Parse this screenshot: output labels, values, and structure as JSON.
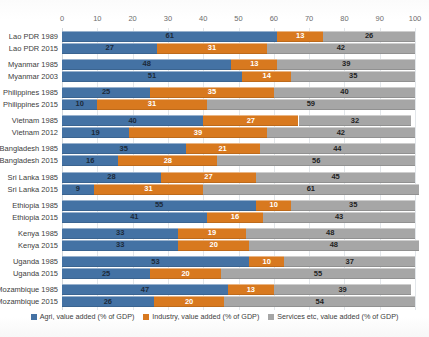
{
  "title": "",
  "chart_data": {
    "type": "bar",
    "orientation": "horizontal",
    "stacked": true,
    "title": "",
    "xlabel": "",
    "ylabel": "",
    "xlim": [
      0,
      100
    ],
    "xticks": [
      0,
      10,
      20,
      30,
      40,
      50,
      60,
      70,
      80,
      90,
      100
    ],
    "grid": true,
    "legend_position": "bottom",
    "colors": {
      "agriculture": "#4472a4",
      "industry": "#d8791f",
      "services": "#a6a6a6"
    },
    "legend": [
      "Agri, value added (% of GDP)",
      "Industry, value added (% of GDP)",
      "Services etc, value added (% of GDP)"
    ],
    "series": [
      {
        "name": "Agri, value added (% of GDP)",
        "key": "agriculture"
      },
      {
        "name": "Industry, value added (% of GDP)",
        "key": "industry"
      },
      {
        "name": "Services etc, value added (% of GDP)",
        "key": "services"
      }
    ],
    "groups": [
      {
        "country": "Lao PDR",
        "rows": [
          {
            "category": "Lao PDR 1989",
            "agriculture": 61,
            "industry": 13,
            "services": 26
          },
          {
            "category": "Lao PDR 2015",
            "agriculture": 27,
            "industry": 31,
            "services": 42
          }
        ]
      },
      {
        "country": "Myanmar",
        "rows": [
          {
            "category": "Myanmar 1985",
            "agriculture": 48,
            "industry": 13,
            "services": 39
          },
          {
            "category": "Myanmar 2003",
            "agriculture": 51,
            "industry": 14,
            "services": 35
          }
        ]
      },
      {
        "country": "Philippines",
        "rows": [
          {
            "category": "Philippines 1985",
            "agriculture": 25,
            "industry": 35,
            "services": 40
          },
          {
            "category": "Philippines 2015",
            "agriculture": 10,
            "industry": 31,
            "services": 59
          }
        ]
      },
      {
        "country": "Vietnam",
        "rows": [
          {
            "category": "Vietnam 1985",
            "agriculture": 40,
            "industry": 27,
            "services": 32
          },
          {
            "category": "Vietnam 2012",
            "agriculture": 19,
            "industry": 39,
            "services": 42
          }
        ]
      },
      {
        "country": "Bangladesh",
        "rows": [
          {
            "category": "Bangladesh 1985",
            "agriculture": 35,
            "industry": 21,
            "services": 44
          },
          {
            "category": "Bangladesh 2015",
            "agriculture": 16,
            "industry": 28,
            "services": 56
          }
        ]
      },
      {
        "country": "Sri Lanka",
        "rows": [
          {
            "category": "Sri Lanka 1985",
            "agriculture": 28,
            "industry": 27,
            "services": 45
          },
          {
            "category": "Sri Lanka 2015",
            "agriculture": 9,
            "industry": 31,
            "services": 61
          }
        ]
      },
      {
        "country": "Ethiopia",
        "rows": [
          {
            "category": "Ethiopia 1985",
            "agriculture": 55,
            "industry": 10,
            "services": 35
          },
          {
            "category": "Ethiopia 2015",
            "agriculture": 41,
            "industry": 16,
            "services": 43
          }
        ]
      },
      {
        "country": "Kenya",
        "rows": [
          {
            "category": "Kenya 1985",
            "agriculture": 33,
            "industry": 19,
            "services": 48
          },
          {
            "category": "Kenya 2015",
            "agriculture": 33,
            "industry": 20,
            "services": 48
          }
        ]
      },
      {
        "country": "Uganda",
        "rows": [
          {
            "category": "Uganda 1985",
            "agriculture": 53,
            "industry": 10,
            "services": 37
          },
          {
            "category": "Uganda 2015",
            "agriculture": 25,
            "industry": 20,
            "services": 55
          }
        ]
      },
      {
        "country": "Mozambique",
        "rows": [
          {
            "category": "Mozambique 1985",
            "agriculture": 47,
            "industry": 13,
            "services": 39
          },
          {
            "category": "Mozambique 2015",
            "agriculture": 26,
            "industry": 20,
            "services": 54
          }
        ]
      }
    ]
  }
}
